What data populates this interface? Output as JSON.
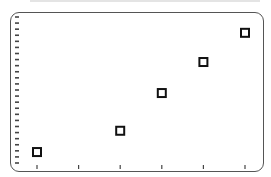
{
  "chart_data": {
    "type": "scatter",
    "title": "",
    "xlabel": "",
    "ylabel": "",
    "x_ticks": [
      0,
      1,
      2,
      3,
      4,
      5
    ],
    "y_tick_count": 25,
    "xlim": [
      0,
      5
    ],
    "ylim": [
      0,
      24
    ],
    "grid": false,
    "legend": null,
    "marker": "hollow-square",
    "series": [
      {
        "name": "data",
        "points": [
          {
            "x": 0,
            "y": 1.8
          },
          {
            "x": 2,
            "y": 5.3
          },
          {
            "x": 3,
            "y": 11.5
          },
          {
            "x": 4,
            "y": 16.6
          },
          {
            "x": 5,
            "y": 21.4
          }
        ]
      }
    ]
  },
  "colors": {
    "frame": "#555555",
    "marker": "#111111",
    "tick": "#444444"
  }
}
